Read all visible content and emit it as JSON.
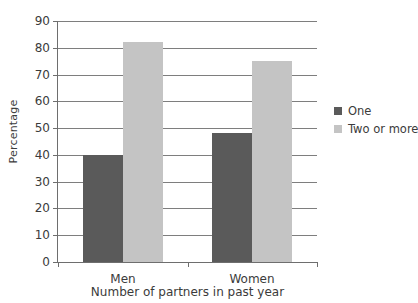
{
  "chart_data": {
    "type": "bar",
    "title": "",
    "xlabel": "Number of partners in past year",
    "ylabel": "Percentage",
    "categories": [
      "Men",
      "Women"
    ],
    "series": [
      {
        "name": "One",
        "values": [
          40,
          48
        ],
        "color": "#5a5a5a"
      },
      {
        "name": "Two or more",
        "values": [
          82,
          75
        ],
        "color": "#c4c4c4"
      }
    ],
    "ylim": [
      0,
      90
    ],
    "ytick_values": [
      0,
      10,
      20,
      30,
      40,
      50,
      60,
      70,
      80,
      90
    ],
    "ytick_labels": [
      "0",
      "10",
      "20",
      "30",
      "40",
      "50",
      "60",
      "70",
      "80",
      "90"
    ],
    "grid": true,
    "legend_position": "right",
    "background_color": "#ffffff",
    "axis_color": "#6e6e6e",
    "gridline_color": "#7e7e7e"
  },
  "legend": {
    "items": [
      {
        "label": "One",
        "color": "#5a5a5a"
      },
      {
        "label": "Two or more",
        "color": "#c4c4c4"
      }
    ]
  }
}
